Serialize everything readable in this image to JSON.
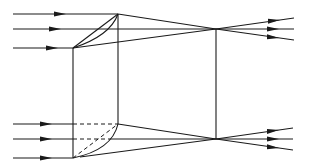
{
  "diagram": {
    "type": "optics-ray-diagram",
    "colors": {
      "line": "#1a1a1a",
      "background": "#ffffff"
    },
    "top_group": {
      "incoming_rays_y": [
        14,
        29,
        48
      ],
      "focal_point": [
        216,
        29
      ],
      "outgoing_ends": [
        [
          294,
          18
        ],
        [
          294,
          29
        ],
        [
          294,
          40
        ]
      ]
    },
    "bottom_group": {
      "incoming_rays_y": [
        124,
        139,
        158
      ],
      "focal_point": [
        216,
        139
      ],
      "outgoing_ends": [
        [
          293,
          128
        ],
        [
          293,
          139
        ],
        [
          293,
          150
        ]
      ]
    },
    "lens_block": {
      "front_edge_x": 73,
      "back_edge_x": 118
    },
    "focal_line_x": 216
  }
}
